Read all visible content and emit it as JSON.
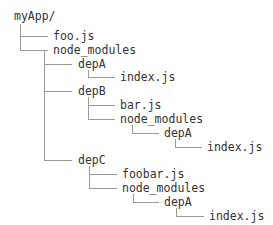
{
  "tree": {
    "root": "myApp/",
    "nodes": [
      {
        "id": "n1",
        "label": "foo.js",
        "depth": 1,
        "x": 53,
        "y": 36
      },
      {
        "id": "n2",
        "label": "node_modules",
        "depth": 1,
        "x": 53,
        "y": 50
      },
      {
        "id": "n3",
        "label": "depA",
        "depth": 2,
        "x": 78,
        "y": 64
      },
      {
        "id": "n4",
        "label": "index.js",
        "depth": 3,
        "x": 120,
        "y": 77
      },
      {
        "id": "n5",
        "label": "depB",
        "depth": 2,
        "x": 78,
        "y": 91
      },
      {
        "id": "n6",
        "label": "bar.js",
        "depth": 3,
        "x": 120,
        "y": 105
      },
      {
        "id": "n7",
        "label": "node_modules",
        "depth": 3,
        "x": 120,
        "y": 119
      },
      {
        "id": "n8",
        "label": "depA",
        "depth": 4,
        "x": 164,
        "y": 133
      },
      {
        "id": "n9",
        "label": "index.js",
        "depth": 5,
        "x": 207,
        "y": 147
      },
      {
        "id": "n10",
        "label": "depC",
        "depth": 2,
        "x": 78,
        "y": 160
      },
      {
        "id": "n11",
        "label": "foobar.js",
        "depth": 3,
        "x": 122,
        "y": 174
      },
      {
        "id": "n12",
        "label": "node_modules",
        "depth": 3,
        "x": 122,
        "y": 188
      },
      {
        "id": "n13",
        "label": "depA",
        "depth": 4,
        "x": 164,
        "y": 202
      },
      {
        "id": "n14",
        "label": "index.js",
        "depth": 5,
        "x": 209,
        "y": 216
      }
    ]
  },
  "colors": {
    "text": "#333333",
    "line": "#9a9a9a",
    "background": "#ffffff"
  }
}
